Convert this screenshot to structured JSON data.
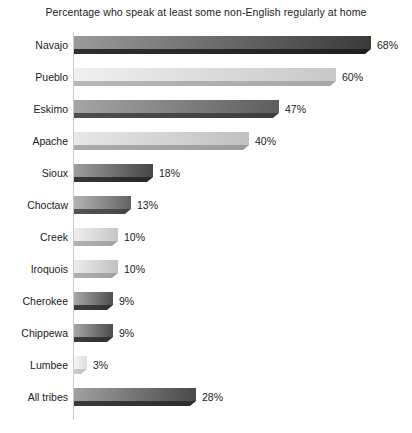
{
  "chart_data": {
    "type": "bar",
    "orientation": "horizontal",
    "title": "Percentage who speak at least some non-English regularly at home",
    "xlabel": "",
    "ylabel": "",
    "xlim": [
      0,
      68
    ],
    "grid": false,
    "legend": "none",
    "value_suffix": "%",
    "categories": [
      "Navajo",
      "Pueblo",
      "Eskimo",
      "Apache",
      "Sioux",
      "Choctaw",
      "Creek",
      "Iroquois",
      "Cherokee",
      "Chippewa",
      "Lumbee",
      "All tribes"
    ],
    "values": [
      68,
      60,
      47,
      40,
      18,
      13,
      10,
      10,
      9,
      9,
      3,
      28
    ],
    "value_labels": [
      "68%",
      "60%",
      "47%",
      "40%",
      "18%",
      "13%",
      "10%",
      "10%",
      "9%",
      "9%",
      "3%",
      "28%"
    ],
    "bars": [
      {
        "label": "Navajo",
        "value": 68,
        "value_label": "68%",
        "face_light": "#9a9a9a",
        "face_dark": "#3a3a3a",
        "shadow": "#2e2e2e",
        "bevel": "#1f1f1f"
      },
      {
        "label": "Pueblo",
        "value": 60,
        "value_label": "60%",
        "face_light": "#f0f0f0",
        "face_dark": "#c8c8c8",
        "shadow": "#b6b6b6",
        "bevel": "#a8a8a8"
      },
      {
        "label": "Eskimo",
        "value": 47,
        "value_label": "47%",
        "face_light": "#a5a5a5",
        "face_dark": "#5e5e5e",
        "shadow": "#4e4e4e",
        "bevel": "#3d3d3d"
      },
      {
        "label": "Apache",
        "value": 40,
        "value_label": "40%",
        "face_light": "#e8e8e8",
        "face_dark": "#c0c0c0",
        "shadow": "#ababab",
        "bevel": "#9c9c9c"
      },
      {
        "label": "Sioux",
        "value": 18,
        "value_label": "18%",
        "face_light": "#9d9d9d",
        "face_dark": "#454545",
        "shadow": "#363636",
        "bevel": "#272727"
      },
      {
        "label": "Choctaw",
        "value": 13,
        "value_label": "13%",
        "face_light": "#b4b4b4",
        "face_dark": "#636363",
        "shadow": "#545454",
        "bevel": "#454545"
      },
      {
        "label": "Creek",
        "value": 10,
        "value_label": "10%",
        "face_light": "#eeeeee",
        "face_dark": "#c6c6c6",
        "shadow": "#b2b2b2",
        "bevel": "#a3a3a3"
      },
      {
        "label": "Iroquois",
        "value": 10,
        "value_label": "10%",
        "face_light": "#ececec",
        "face_dark": "#c2c2c2",
        "shadow": "#afafaf",
        "bevel": "#a0a0a0"
      },
      {
        "label": "Cherokee",
        "value": 9,
        "value_label": "9%",
        "face_light": "#a8a8a8",
        "face_dark": "#4e4e4e",
        "shadow": "#3f3f3f",
        "bevel": "#303030"
      },
      {
        "label": "Chippewa",
        "value": 9,
        "value_label": "9%",
        "face_light": "#a6a6a6",
        "face_dark": "#4c4c4c",
        "shadow": "#3d3d3d",
        "bevel": "#2e2e2e"
      },
      {
        "label": "Lumbee",
        "value": 3,
        "value_label": "3%",
        "face_light": "#f6f6f6",
        "face_dark": "#dedede",
        "shadow": "#cdcdcd",
        "bevel": "#bdbdbd"
      },
      {
        "label": "All tribes",
        "value": 28,
        "value_label": "28%",
        "face_light": "#a0a0a0",
        "face_dark": "#4a4a4a",
        "shadow": "#3b3b3b",
        "bevel": "#2c2c2c"
      }
    ]
  }
}
